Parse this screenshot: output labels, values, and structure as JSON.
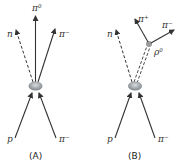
{
  "diagram": {
    "panel_a": {
      "caption": "(A)",
      "incoming": [
        {
          "particle": "p",
          "label": "p"
        },
        {
          "particle": "pi-minus",
          "label": "π",
          "charge": "−"
        }
      ],
      "outgoing": [
        {
          "particle": "neutron",
          "label": "n",
          "style": "dashed"
        },
        {
          "particle": "pi-zero",
          "label": "π",
          "charge": "0",
          "style": "solid"
        },
        {
          "particle": "pi-minus",
          "label": "π",
          "charge": "−",
          "style": "solid"
        }
      ]
    },
    "panel_b": {
      "caption": "(B)",
      "incoming": [
        {
          "particle": "p",
          "label": "p"
        },
        {
          "particle": "pi-minus",
          "label": "π",
          "charge": "−"
        }
      ],
      "outgoing": [
        {
          "particle": "neutron",
          "label": "n",
          "style": "dashed"
        },
        {
          "particle": "rho-zero",
          "label": "ρ",
          "charge": "0",
          "style": "double-dashed"
        }
      ],
      "decay": [
        {
          "particle": "pi-plus",
          "label": "π",
          "charge": "+"
        },
        {
          "particle": "pi-minus",
          "label": "π",
          "charge": "−"
        }
      ]
    },
    "colors": {
      "line": "#333333",
      "vertex": "#8a8f94",
      "decay_vertex": "#9a9a9a"
    }
  }
}
